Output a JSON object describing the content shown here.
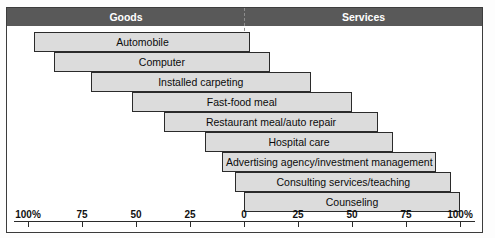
{
  "figure": {
    "title": "",
    "bands": [
      {
        "name": "goods-band",
        "label": "Goods"
      },
      {
        "name": "services-band",
        "label": "Services"
      }
    ]
  },
  "chart_data": {
    "type": "bar",
    "title": "",
    "xlabel": "",
    "ylabel": "",
    "orientation": "horizontal",
    "layout": "diverging-tangible-intangible",
    "note": "Each bar spans from a percentage on the Goods (tangible) side to a percentage on the Services (intangible) side of the 0 center line.",
    "grid": false,
    "legend": false,
    "axis": {
      "center_value": 0,
      "left_axis_label": "Goods",
      "right_axis_label": "Services",
      "tick_labels_left": [
        "100%",
        "75",
        "50",
        "25",
        "0"
      ],
      "tick_labels_right": [
        "0",
        "25",
        "50",
        "75",
        "100%"
      ],
      "tick_values_left": [
        100,
        75,
        50,
        25,
        0
      ],
      "tick_values_right": [
        0,
        25,
        50,
        75,
        100
      ],
      "xlim": [
        -100,
        100
      ]
    },
    "categories": [
      "Automobile",
      "Computer",
      "Installed carpeting",
      "Fast-food meal",
      "Restaurant meal/auto repair",
      "Hospital care",
      "Advertising agency/investment management",
      "Consulting services/teaching",
      "Counseling"
    ],
    "bars": [
      {
        "label": "Automobile",
        "goods_pct": 97,
        "services_pct": 3
      },
      {
        "label": "Computer",
        "goods_pct": 88,
        "services_pct": 12
      },
      {
        "label": "Installed carpeting",
        "goods_pct": 71,
        "services_pct": 31
      },
      {
        "label": "Fast-food meal",
        "goods_pct": 52,
        "services_pct": 50
      },
      {
        "label": "Restaurant meal/auto repair",
        "goods_pct": 37,
        "services_pct": 62
      },
      {
        "label": "Hospital care",
        "goods_pct": 18,
        "services_pct": 69
      },
      {
        "label": "Advertising agency/investment management",
        "goods_pct": 10,
        "services_pct": 89
      },
      {
        "label": "Consulting services/teaching",
        "goods_pct": 4,
        "services_pct": 96
      },
      {
        "label": "Counseling",
        "goods_pct": 0,
        "services_pct": 100
      }
    ]
  }
}
